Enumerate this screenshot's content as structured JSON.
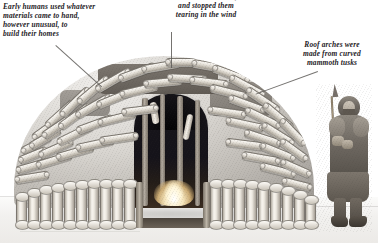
{
  "illustration": {
    "title": "Mammoth bone hut",
    "subject": "Prehistoric mammoth-bone dwelling with Ice Age hunter",
    "style": "grayscale pencil illustration",
    "background_color": "#ffffff",
    "caption_color": "#23201e",
    "leader_line_color": "#5d5a57"
  },
  "captions": {
    "left": {
      "id": "materials-caption",
      "text": "Early humans used whatever\nmaterials came to hand,\nhowever unusual, to\nbuild their homes"
    },
    "middle": {
      "id": "hides-caption",
      "text": "down animal hides,\nand stopped them\ntearing in the wind"
    },
    "right": {
      "id": "tusks-caption",
      "text": "Roof arches were\nmade from curved\nmammoth tusks"
    }
  },
  "scene": {
    "hut": {
      "name": "mammoth-bone-hut",
      "roof_material": "stacked mammoth bones over animal hides",
      "base_ring": "vertical mammoth leg bones",
      "doorway": "dark arched entrance",
      "interior": "fire glow and upright posts"
    },
    "figure": {
      "name": "ice-age-hunter",
      "description": "bearded man in fur parka holding a spear"
    },
    "ground": {
      "name": "snow-ground",
      "description": "pale snow-covered ground"
    }
  }
}
